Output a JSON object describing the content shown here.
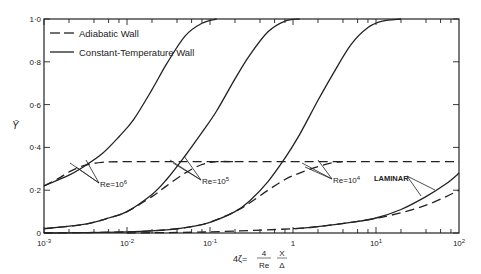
{
  "chart_data": {
    "type": "line",
    "title": "",
    "xlabel": "4ζ = (4/Re)(X/Δ)",
    "xlabel_parts": {
      "prefix": "4ζ=",
      "num": "4",
      "den": "Re",
      "num2": "X",
      "den2": "Δ"
    },
    "ylabel": "Ȳ",
    "xscale": "log",
    "xlim": [
      0.001,
      100
    ],
    "ylim": [
      0,
      1.0
    ],
    "x_ticks": [
      {
        "value": 0.001,
        "label_base": "10",
        "label_exp": "-3"
      },
      {
        "value": 0.01,
        "label_base": "10",
        "label_exp": "-2"
      },
      {
        "value": 0.1,
        "label_base": "10",
        "label_exp": "-1"
      },
      {
        "value": 1,
        "label_base": "1",
        "label_exp": ""
      },
      {
        "value": 10,
        "label_base": "10",
        "label_exp": "1"
      },
      {
        "value": 100,
        "label_base": "10",
        "label_exp": "2"
      }
    ],
    "y_ticks": [
      {
        "value": 0,
        "label": "0"
      },
      {
        "value": 0.2,
        "label": "0·2"
      },
      {
        "value": 0.4,
        "label": "0·4"
      },
      {
        "value": 0.6,
        "label": "0·6"
      },
      {
        "value": 0.8,
        "label": "0·8"
      },
      {
        "value": 1.0,
        "label": "1·0"
      }
    ],
    "grid": false,
    "legend": {
      "position": "upper-left",
      "entries": [
        {
          "label": "Adiabatic Wall",
          "style": "dashed"
        },
        {
          "label": "Constant-Temperature Wall",
          "style": "solid"
        }
      ]
    },
    "series": [
      {
        "name": "Re=10^6 Constant-Temperature",
        "style": "solid",
        "x": [
          0.001,
          0.002,
          0.003,
          0.005,
          0.008,
          0.012,
          0.02,
          0.03,
          0.05,
          0.08,
          0.12
        ],
        "y": [
          0.22,
          0.27,
          0.31,
          0.37,
          0.45,
          0.53,
          0.67,
          0.79,
          0.92,
          0.98,
          1.0
        ]
      },
      {
        "name": "Re=10^6 Adiabatic",
        "style": "dashed",
        "x": [
          0.001,
          0.0015,
          0.002,
          0.003,
          0.005,
          0.01,
          0.1,
          100
        ],
        "y": [
          0.22,
          0.255,
          0.285,
          0.315,
          0.33,
          0.333,
          0.333,
          0.333
        ]
      },
      {
        "name": "Re=10^5 Constant-Temperature",
        "style": "solid",
        "x": [
          0.001,
          0.003,
          0.006,
          0.01,
          0.02,
          0.03,
          0.05,
          0.08,
          0.12,
          0.2,
          0.3,
          0.5,
          0.8,
          1.2
        ],
        "y": [
          0.02,
          0.04,
          0.07,
          0.1,
          0.18,
          0.25,
          0.36,
          0.47,
          0.57,
          0.72,
          0.83,
          0.94,
          0.99,
          1.0
        ]
      },
      {
        "name": "Re=10^5 Adiabatic",
        "style": "dashed",
        "x": [
          0.001,
          0.003,
          0.006,
          0.01,
          0.02,
          0.03,
          0.05,
          0.08,
          0.12,
          0.2
        ],
        "y": [
          0.02,
          0.04,
          0.07,
          0.1,
          0.17,
          0.22,
          0.28,
          0.32,
          0.333,
          0.333
        ]
      },
      {
        "name": "Re=10^4 Constant-Temperature",
        "style": "solid",
        "x": [
          0.001,
          0.01,
          0.03,
          0.06,
          0.1,
          0.2,
          0.3,
          0.5,
          0.8,
          1.2,
          2,
          3,
          5,
          8,
          12,
          20
        ],
        "y": [
          0.0,
          0.005,
          0.015,
          0.03,
          0.05,
          0.1,
          0.15,
          0.24,
          0.35,
          0.46,
          0.62,
          0.74,
          0.88,
          0.96,
          0.99,
          1.0
        ]
      },
      {
        "name": "Re=10^4 Adiabatic",
        "style": "dashed",
        "x": [
          0.001,
          0.01,
          0.03,
          0.06,
          0.1,
          0.2,
          0.3,
          0.5,
          0.8,
          1.2,
          2,
          3,
          4
        ],
        "y": [
          0.0,
          0.005,
          0.015,
          0.03,
          0.05,
          0.1,
          0.14,
          0.2,
          0.25,
          0.28,
          0.31,
          0.328,
          0.333
        ]
      },
      {
        "name": "Laminar Constant-Temperature",
        "style": "solid",
        "x": [
          1,
          2,
          5,
          10,
          20,
          40,
          70,
          100
        ],
        "y": [
          0.02,
          0.03,
          0.05,
          0.07,
          0.11,
          0.17,
          0.23,
          0.28
        ]
      },
      {
        "name": "Laminar Adiabatic",
        "style": "dashed",
        "x": [
          0.01,
          0.1,
          1,
          2,
          5,
          10,
          20,
          40,
          70,
          100
        ],
        "y": [
          0.0,
          0.005,
          0.02,
          0.03,
          0.05,
          0.068,
          0.095,
          0.13,
          0.17,
          0.2
        ]
      }
    ],
    "annotations": [
      {
        "text_base": "Re=10",
        "text_exp": "6",
        "x_px": 100,
        "y_px": 184
      },
      {
        "text_base": "Re=10",
        "text_exp": "5",
        "x_px": 202,
        "y_px": 181
      },
      {
        "text_base": "Re=10",
        "text_exp": "4",
        "x_px": 333,
        "y_px": 180
      },
      {
        "text": "LAMINAR",
        "x_px": 374,
        "y_px": 178
      }
    ]
  }
}
